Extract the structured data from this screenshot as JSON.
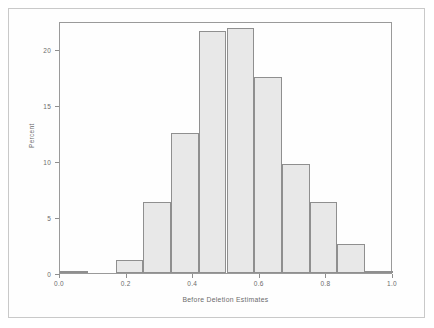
{
  "chart_data": {
    "type": "bar",
    "title": "",
    "subtitle": "",
    "xlabel": "Before Deletion Estimates",
    "ylabel": "Percent",
    "xlim": [
      0.0,
      1.0
    ],
    "ylim": [
      0,
      22.5
    ],
    "grid": false,
    "legend": null,
    "bin_width": 0.0833,
    "x_tick_labels": [
      "0.0",
      "0.2",
      "0.4",
      "0.6",
      "0.8",
      "1.0"
    ],
    "x_tick_values": [
      0.0,
      0.2,
      0.4,
      0.6,
      0.8,
      1.0
    ],
    "y_tick_labels": [
      "0",
      "5",
      "10",
      "15",
      "20"
    ],
    "y_tick_values": [
      0,
      5,
      10,
      15,
      20
    ],
    "bins": [
      {
        "left": 0.0,
        "right": 0.0833,
        "value": 0.2
      },
      {
        "left": 0.0833,
        "right": 0.1667,
        "value": 0.0
      },
      {
        "left": 0.1667,
        "right": 0.25,
        "value": 1.2
      },
      {
        "left": 0.25,
        "right": 0.3333,
        "value": 6.3
      },
      {
        "left": 0.3333,
        "right": 0.4167,
        "value": 12.5
      },
      {
        "left": 0.4167,
        "right": 0.5,
        "value": 21.6
      },
      {
        "left": 0.5,
        "right": 0.5833,
        "value": 21.9
      },
      {
        "left": 0.5833,
        "right": 0.6667,
        "value": 17.5
      },
      {
        "left": 0.6667,
        "right": 0.75,
        "value": 9.7
      },
      {
        "left": 0.75,
        "right": 0.8333,
        "value": 6.3
      },
      {
        "left": 0.8333,
        "right": 0.9167,
        "value": 2.6
      },
      {
        "left": 0.9167,
        "right": 1.0,
        "value": 0.2
      }
    ],
    "categories": [
      "0.00-0.08",
      "0.08-0.17",
      "0.17-0.25",
      "0.25-0.33",
      "0.33-0.42",
      "0.42-0.50",
      "0.50-0.58",
      "0.58-0.67",
      "0.67-0.75",
      "0.75-0.83",
      "0.83-0.92",
      "0.92-1.00"
    ],
    "values": [
      0.2,
      0.0,
      1.2,
      6.3,
      12.5,
      21.6,
      21.9,
      17.5,
      9.7,
      6.3,
      2.6,
      0.2
    ],
    "colors": {
      "bar_fill": "#e8e8e8",
      "bar_border": "#8f8f8f",
      "axis": "#9a9a9a",
      "text": "#6b6b6b",
      "outer_frame": "#c9c9c9",
      "background": "#ffffff"
    }
  }
}
